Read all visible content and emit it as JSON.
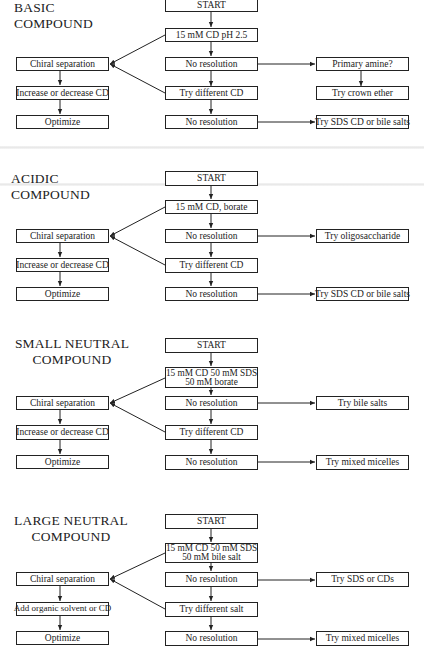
{
  "sections": [
    {
      "title_lines": [
        "BASIC COMPOUND"
      ],
      "middle": [
        "START",
        "15 mM CD pH 2.5",
        "No resolution",
        "Try different CD",
        "No resolution"
      ],
      "left": [
        "Chiral separation",
        "Increase or decrease CD",
        "Optimize"
      ],
      "right_top": "Primary amine?",
      "right_mid": "Try crown ether",
      "right_bottom": "Try SDS CD or bile salts"
    },
    {
      "title_lines": [
        "ACIDIC COMPOUND"
      ],
      "middle": [
        "START",
        "15 mM CD, borate",
        "No resolution",
        "Try different CD",
        "No resolution"
      ],
      "left": [
        "Chiral separation",
        "Increase or decrease CD",
        "Optimize"
      ],
      "right_top": "Try oligosaccharide",
      "right_bottom": "Try SDS CD or bile salts"
    },
    {
      "title_lines": [
        "SMALL NEUTRAL",
        "COMPOUND"
      ],
      "middle": [
        "START",
        [
          "15 mM CD 50 mM SDS",
          "50 mM borate"
        ],
        "No resolution",
        "Try different CD",
        "No resolution"
      ],
      "left": [
        "Chiral separation",
        "Increase or decrease CD",
        "Optimize"
      ],
      "right_top": "Try bile salts",
      "right_bottom": "Try mixed micelles"
    },
    {
      "title_lines": [
        "LARGE NEUTRAL",
        "COMPOUND"
      ],
      "middle": [
        "START",
        [
          "15 mM CD 50 mM SDS",
          "50 mM bile salt"
        ],
        "No resolution",
        "Try different salt",
        "No resolution"
      ],
      "left": [
        "Chiral separation",
        "Add organic solvent or CD",
        "Optimize"
      ],
      "right_top": "Try SDS or CDs",
      "right_bottom": "Try mixed micelles"
    }
  ],
  "style": {
    "line_color": "#222222",
    "background": "#ffffff"
  }
}
